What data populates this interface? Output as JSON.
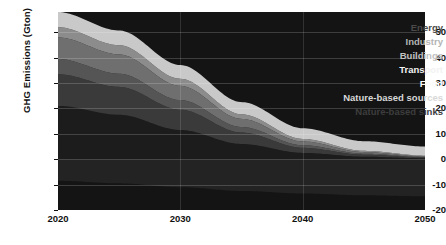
{
  "chart_data": {
    "type": "area",
    "stacked": true,
    "title": "",
    "xlabel": "",
    "ylabel": "GHG Emissions (Gton)",
    "x": [
      2020,
      2025,
      2030,
      2035,
      2040,
      2045,
      2050
    ],
    "xlim": [
      2020,
      2050
    ],
    "ylim": [
      -20,
      58
    ],
    "xticks": [
      "2020",
      "2030",
      "2040",
      "2050"
    ],
    "yticks": [
      "50",
      "40",
      "30",
      "20",
      "10",
      "0",
      "-10",
      "-20"
    ],
    "grid": true,
    "legend_position": "inside-top-right",
    "background": "#141414",
    "series": [
      {
        "name": "Energy",
        "color": "#1c1c1c",
        "values": [
          21.0,
          17.5,
          11.5,
          6.0,
          2.5,
          1.0,
          0.4
        ]
      },
      {
        "name": "Industry",
        "color": "#3a3a3a",
        "values": [
          12.5,
          11.0,
          8.0,
          4.5,
          2.0,
          0.8,
          0.3
        ]
      },
      {
        "name": "Buildings",
        "color": "#555555",
        "values": [
          6.0,
          5.2,
          3.8,
          2.2,
          1.0,
          0.4,
          0.2
        ]
      },
      {
        "name": "Transport",
        "color": "#6f6f6f",
        "values": [
          8.5,
          7.6,
          5.6,
          3.2,
          1.5,
          0.6,
          0.2
        ]
      },
      {
        "name": "Food",
        "color": "#8c8c8c",
        "values": [
          4.0,
          3.6,
          2.8,
          1.8,
          1.0,
          0.5,
          0.3
        ]
      },
      {
        "name": "Nature-based sources",
        "color": "#c9c9c9",
        "values": [
          6.0,
          5.8,
          5.4,
          4.8,
          4.2,
          3.8,
          3.6
        ]
      },
      {
        "name": "Nature-based sinks",
        "color": "#232323",
        "values": [
          -8.5,
          -9.5,
          -11.0,
          -12.5,
          -13.5,
          -14.2,
          -14.6
        ]
      }
    ]
  },
  "axis": {
    "ylabel": "GHG Emissions (Gton)",
    "yticks": [
      {
        "label": "50"
      },
      {
        "label": "40"
      },
      {
        "label": "30"
      },
      {
        "label": "20"
      },
      {
        "label": "10"
      },
      {
        "label": "0"
      },
      {
        "label": "-10"
      },
      {
        "label": "-20"
      }
    ],
    "xticks": [
      {
        "label": "2020"
      },
      {
        "label": "2030"
      },
      {
        "label": "2040"
      },
      {
        "label": "2050"
      }
    ]
  },
  "legend": {
    "items": [
      {
        "label": "Energy",
        "color": "#4a4a4a"
      },
      {
        "label": "Industry",
        "color": "#b4b4b4"
      },
      {
        "label": "Buildings",
        "color": "#c2c2c2"
      },
      {
        "label": "Transport",
        "color": "#f2f2f2"
      },
      {
        "label": "Food",
        "color": "#fbfbfb"
      },
      {
        "label": "Nature-based sources",
        "color": "#d8d8d8"
      },
      {
        "label": "Nature-based sinks",
        "color": "#3d3d3d"
      }
    ]
  }
}
